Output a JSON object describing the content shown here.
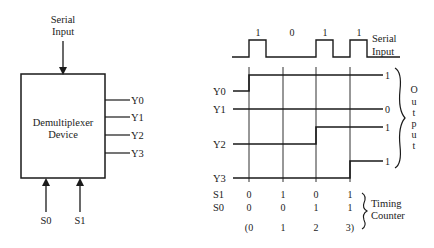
{
  "block_diagram": {
    "device_label_line1": "Demultiplexer",
    "device_label_line2": "Device",
    "input_label_line1": "Serial",
    "input_label_line2": "Input",
    "outputs": [
      "Y0",
      "Y1",
      "Y2",
      "Y3"
    ],
    "selects": [
      "S0",
      "S1"
    ]
  },
  "timing_diagram": {
    "serial_input_label_line1": "Serial",
    "serial_input_label_line2": "Input",
    "serial_bits": [
      "1",
      "0",
      "1",
      "1"
    ],
    "output_rows": [
      {
        "name": "Y0",
        "final_value": "1"
      },
      {
        "name": "Y1",
        "final_value": "0"
      },
      {
        "name": "Y2",
        "final_value": "1"
      },
      {
        "name": "Y3",
        "final_value": "1"
      }
    ],
    "output_brace_label": [
      "O",
      "u",
      "t",
      "p",
      "u",
      "t"
    ],
    "select_rows": [
      {
        "name": "S1",
        "values": [
          "0",
          "1",
          "0",
          "1"
        ]
      },
      {
        "name": "S0",
        "values": [
          "0",
          "0",
          "1",
          "1"
        ]
      }
    ],
    "counter_values": [
      "(0",
      "1",
      "2",
      "3)"
    ],
    "counter_label_line1": "Timing",
    "counter_label_line2": "Counter"
  }
}
